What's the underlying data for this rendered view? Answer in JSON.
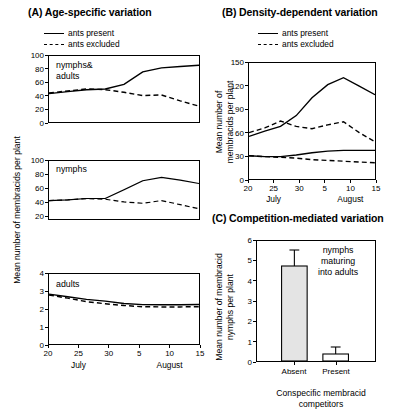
{
  "figure": {
    "panels": {
      "a": {
        "title": "(A) Age-specific variation"
      },
      "b": {
        "title": "(B) Density-dependent variation"
      },
      "c": {
        "title": "(C) Competition-mediated variation"
      }
    }
  },
  "legend": {
    "present": "ants present",
    "excluded": "ants excluded"
  },
  "axis_labels": {
    "a_y": "Mean number of membracids per plant",
    "b_y_line1": "Mean number of",
    "b_y_line2": "membracids per plant",
    "c_y_line1": "Mean number of membracid",
    "c_y_line2": "nymphs per plant",
    "c_x_line1": "Conspecific membracid",
    "c_x_line2": "competitors",
    "month_july": "July",
    "month_august": "August"
  },
  "panel_labels": {
    "a1": "nymphs&",
    "a1b": "adults",
    "a2": "nymphs",
    "a3": "adults",
    "c_note1": "nymphs",
    "c_note2": "maturing",
    "c_note3": "into adults"
  },
  "ticks": {
    "a1_y": [
      "0",
      "20",
      "40",
      "60",
      "80",
      "100"
    ],
    "a2_y": [
      "20",
      "40",
      "60",
      "80",
      "100"
    ],
    "a3_y": [
      "0",
      "1",
      "2",
      "3",
      "4"
    ],
    "date_x": [
      "20",
      "25",
      "30",
      "5",
      "10",
      "15"
    ],
    "b_y": [
      "0",
      "30",
      "60",
      "90",
      "120",
      "150"
    ],
    "c_y": [
      "0",
      "1",
      "2",
      "3",
      "4",
      "5",
      "6"
    ],
    "c_x": [
      "Absent",
      "Present"
    ]
  },
  "chart_data": [
    {
      "type": "line",
      "id": "A1",
      "title": "nymphs & adults",
      "xlabel": "",
      "ylabel": "Mean number of membracids per plant",
      "ylim": [
        0,
        100
      ],
      "xtick_labels": [
        "20",
        "25",
        "30",
        "5",
        "10",
        "15"
      ],
      "x": [
        19,
        23,
        26,
        29,
        2,
        6,
        10,
        14,
        17
      ],
      "grid": false,
      "legend_position": "above-plot",
      "series": [
        {
          "name": "ants present",
          "style": "solid",
          "values": [
            43,
            46,
            49,
            50,
            57,
            76,
            82,
            84,
            86
          ]
        },
        {
          "name": "ants excluded",
          "style": "dashed",
          "values": [
            44,
            47,
            50,
            49,
            45,
            40,
            41,
            32,
            24
          ]
        }
      ]
    },
    {
      "type": "line",
      "id": "A2",
      "title": "nymphs",
      "xlabel": "",
      "ylabel": "Mean number of membracids per plant",
      "ylim": [
        0,
        100
      ],
      "xtick_labels": [
        "20",
        "25",
        "30",
        "5",
        "10",
        "15"
      ],
      "x": [
        19,
        23,
        26,
        29,
        2,
        6,
        10,
        14,
        17
      ],
      "grid": false,
      "series": [
        {
          "name": "ants present",
          "style": "solid",
          "values": [
            42,
            43,
            45,
            45,
            58,
            71,
            76,
            72,
            67
          ]
        },
        {
          "name": "ants excluded",
          "style": "dashed",
          "values": [
            42,
            43,
            45,
            44,
            40,
            38,
            42,
            36,
            30
          ]
        }
      ]
    },
    {
      "type": "line",
      "id": "A3",
      "title": "adults",
      "xlabel": "",
      "ylabel": "Mean number of membracids per plant",
      "ylim": [
        0,
        4
      ],
      "xtick_labels": [
        "20",
        "25",
        "30",
        "5",
        "10",
        "15"
      ],
      "x": [
        19,
        23,
        26,
        29,
        2,
        6,
        10,
        14,
        17
      ],
      "grid": false,
      "series": [
        {
          "name": "ants present",
          "style": "solid",
          "values": [
            2.85,
            2.7,
            2.55,
            2.45,
            2.32,
            2.25,
            2.24,
            2.24,
            2.26
          ]
        },
        {
          "name": "ants excluded",
          "style": "dashed",
          "values": [
            2.8,
            2.62,
            2.42,
            2.3,
            2.2,
            2.13,
            2.12,
            2.12,
            2.13
          ]
        }
      ]
    },
    {
      "type": "line",
      "id": "B",
      "title": "Density-dependent variation",
      "xlabel": "",
      "ylabel": "Mean number of membracids per plant",
      "ylim": [
        0,
        150
      ],
      "xtick_labels": [
        "20",
        "25",
        "30",
        "5",
        "10",
        "15"
      ],
      "x": [
        19,
        23,
        26,
        29,
        2,
        6,
        10,
        14,
        17
      ],
      "grid": false,
      "series": [
        {
          "name": "ants present high density",
          "style": "solid",
          "values": [
            55,
            62,
            68,
            82,
            105,
            122,
            131,
            120,
            109
          ]
        },
        {
          "name": "ants excluded high density",
          "style": "dashed",
          "values": [
            60,
            66,
            75,
            68,
            65,
            70,
            74,
            60,
            48
          ]
        },
        {
          "name": "ants present low density",
          "style": "solid",
          "values": [
            30,
            29,
            29,
            31,
            34,
            36,
            37,
            37,
            37
          ]
        },
        {
          "name": "ants excluded low density",
          "style": "dashed",
          "values": [
            30,
            29,
            28,
            27,
            25,
            24,
            23,
            22,
            21
          ]
        }
      ]
    },
    {
      "type": "bar",
      "id": "C",
      "title": "Competition-mediated variation",
      "xlabel": "Conspecific membracid competitors",
      "ylabel": "Mean number of membracid nymphs per plant",
      "ylim": [
        0,
        6
      ],
      "categories": [
        "Absent",
        "Present"
      ],
      "values": [
        4.75,
        0.35
      ],
      "errors": [
        0.8,
        0.35
      ],
      "annotation": "nymphs maturing into adults",
      "grid": false
    }
  ]
}
